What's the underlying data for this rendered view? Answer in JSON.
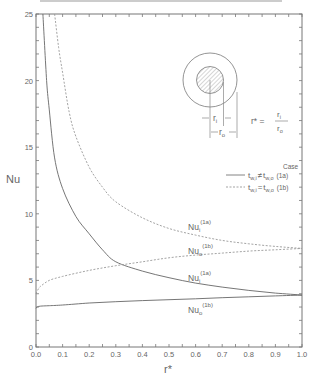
{
  "chart_data": {
    "type": "line",
    "title": "",
    "xlabel": "r*",
    "ylabel": "Nu",
    "xlim": [
      0.0,
      1.0
    ],
    "ylim": [
      0,
      25
    ],
    "x_ticks": [
      "0.0",
      "0.1",
      "0.2",
      "0.3",
      "0.4",
      "0.5",
      "0.6",
      "0.7",
      "0.8",
      "0.9",
      "1.0"
    ],
    "y_ticks": [
      "0",
      "5",
      "10",
      "15",
      "20",
      "25"
    ],
    "grid": false,
    "legend": {
      "title": "Case",
      "position": "right-middle",
      "entries": [
        {
          "label": "t_w,i ≠ t_w,o",
          "case": "(1a)",
          "style": "solid"
        },
        {
          "label": "t_w,i = t_w,o",
          "case": "(1b)",
          "style": "dashed"
        }
      ]
    },
    "inset": {
      "description": "Concentric annulus cross-section with hatched inner core",
      "labels": [
        "r_i",
        "r_o"
      ],
      "equation": "r* = r_i / r_o"
    },
    "series": [
      {
        "name": "Nu_i (1a)",
        "style": "solid",
        "x": [
          0.026,
          0.04,
          0.05,
          0.07,
          0.1,
          0.15,
          0.2,
          0.25,
          0.3,
          0.4,
          0.5,
          0.6,
          0.7,
          0.8,
          0.9,
          1.0
        ],
        "y": [
          25.0,
          20.0,
          17.8,
          14.2,
          11.9,
          9.8,
          8.5,
          7.3,
          6.4,
          5.7,
          5.2,
          4.8,
          4.5,
          4.25,
          4.05,
          3.9
        ]
      },
      {
        "name": "Nu_o (1a)",
        "style": "solid",
        "x": [
          0.0,
          0.01,
          0.05,
          0.1,
          0.2,
          0.3,
          0.4,
          0.5,
          0.6,
          0.7,
          0.8,
          0.9,
          1.0
        ],
        "y": [
          2.9,
          3.05,
          3.1,
          3.15,
          3.3,
          3.4,
          3.48,
          3.55,
          3.62,
          3.7,
          3.77,
          3.84,
          3.9
        ]
      },
      {
        "name": "Nu_i (1b)",
        "style": "dashed",
        "x": [
          0.07,
          0.085,
          0.1,
          0.125,
          0.15,
          0.2,
          0.25,
          0.3,
          0.4,
          0.5,
          0.6,
          0.7,
          0.8,
          0.9,
          1.0
        ],
        "y": [
          25.0,
          22.5,
          20.6,
          17.6,
          15.8,
          13.5,
          12.0,
          10.9,
          9.7,
          8.9,
          8.4,
          8.0,
          7.75,
          7.55,
          7.4
        ]
      },
      {
        "name": "Nu_o (1b)",
        "style": "dashed",
        "x": [
          0.0,
          0.01,
          0.02,
          0.05,
          0.1,
          0.2,
          0.3,
          0.4,
          0.5,
          0.6,
          0.7,
          0.8,
          0.9,
          1.0
        ],
        "y": [
          4.0,
          4.4,
          4.6,
          5.0,
          5.3,
          5.75,
          6.1,
          6.4,
          6.7,
          6.9,
          7.05,
          7.2,
          7.3,
          7.4
        ]
      }
    ],
    "annotations": [
      {
        "text": "Nu_i",
        "sup": "(1a)",
        "x": 0.6,
        "y": 8.3,
        "series": "Nu_i (1b) label"
      },
      {
        "text": "Nu_o",
        "sup": "(1b)",
        "x": 0.6,
        "y": 6.3
      },
      {
        "text": "Nu_i",
        "sup": "(1a)",
        "x": 0.6,
        "y": 4.6
      },
      {
        "text": "Nu_o",
        "sup": "(1b)",
        "x": 0.6,
        "y": 2.1
      }
    ]
  },
  "labels": {
    "ylabel": "Nu",
    "xlabel": "r*",
    "legend_title": "Case",
    "legend_1a_lhs": "t",
    "legend_1a_sub1": "w,i",
    "legend_1a_op": "≠",
    "legend_1a_rhs": "t",
    "legend_1a_sub2": "w,o",
    "legend_1a_case": "(1a)",
    "legend_1b_lhs": "t",
    "legend_1b_sub1": "w,i",
    "legend_1b_op": "=",
    "legend_1b_rhs": "t",
    "legend_1b_sub2": "w,o",
    "legend_1b_case": "(1b)",
    "inset_ri": "r",
    "inset_ri_sub": "i",
    "inset_ro": "r",
    "inset_ro_sub": "o",
    "eq_lhs": "r* =",
    "eq_num": "r",
    "eq_num_sub": "i",
    "eq_den": "r",
    "eq_den_sub": "o",
    "ann1_main": "Nu",
    "ann1_sub": "i",
    "ann1_sup": "(1a)",
    "ann2_main": "Nu",
    "ann2_sub": "o",
    "ann2_sup": "(1b)",
    "ann3_main": "Nu",
    "ann3_sub": "i",
    "ann3_sup": "(1a)",
    "ann4_main": "Nu",
    "ann4_sub": "o",
    "ann4_sup": "(1b)"
  }
}
